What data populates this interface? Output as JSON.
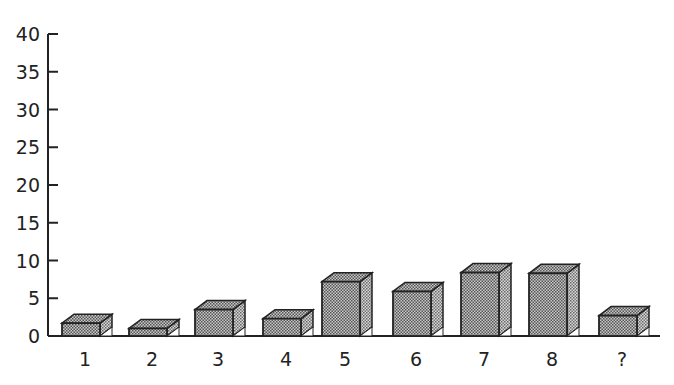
{
  "chart_data": {
    "type": "bar",
    "style": "3d-box",
    "title": "",
    "xlabel": "",
    "ylabel": "",
    "categories": [
      "1",
      "2",
      "3",
      "4",
      "5",
      "6",
      "7",
      "8",
      "?"
    ],
    "values": [
      1.7,
      1.0,
      3.5,
      2.3,
      7.2,
      5.9,
      8.4,
      8.3,
      2.7
    ],
    "ylim": [
      0,
      40
    ],
    "yticks": [
      0,
      5,
      10,
      15,
      20,
      25,
      30,
      35,
      40
    ],
    "ytick_labels": [
      "0",
      "5",
      "10",
      "15",
      "20",
      "25",
      "30",
      "35",
      "40"
    ],
    "grid": false,
    "legend": null,
    "bar_fill": "#a8a8a8",
    "bar_stroke": "#222222"
  }
}
